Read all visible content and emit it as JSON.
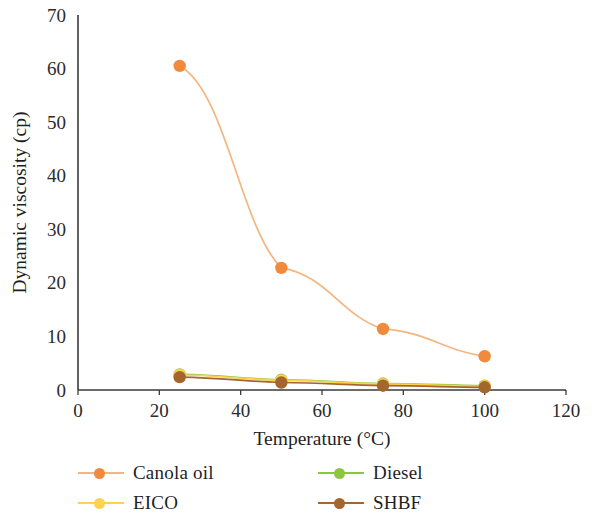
{
  "chart_data": {
    "type": "line",
    "title": "",
    "xlabel": "Temperature (°C)",
    "ylabel": "Dynamic viscosity (cp)",
    "xlim": [
      0,
      120
    ],
    "ylim": [
      0,
      70
    ],
    "xticks": [
      0,
      20,
      40,
      60,
      80,
      100,
      120
    ],
    "yticks": [
      0,
      10,
      20,
      30,
      40,
      50,
      60,
      70
    ],
    "xtick_labels": [
      "0",
      "20",
      "40",
      "60",
      "80",
      "100",
      "120"
    ],
    "ytick_labels": [
      "0",
      "10",
      "20",
      "30",
      "40",
      "50",
      "60",
      "70"
    ],
    "grid": false,
    "legend_position": "bottom",
    "x": [
      25,
      50,
      75,
      100
    ],
    "series": [
      {
        "name": "Canola oil",
        "color": "#F08A3C",
        "line_color": "#F3B681",
        "values": [
          60.5,
          22.8,
          11.4,
          6.3
        ]
      },
      {
        "name": "Diesel",
        "color": "#8CC63F",
        "line_color": "#8CC63F",
        "values": [
          2.9,
          1.9,
          1.2,
          0.8
        ]
      },
      {
        "name": "EICO",
        "color": "#FFD24D",
        "line_color": "#FFD24D",
        "values": [
          2.8,
          1.8,
          1.1,
          0.7
        ]
      },
      {
        "name": "SHBF",
        "color": "#A4652E",
        "line_color": "#A4652E",
        "values": [
          2.4,
          1.4,
          0.8,
          0.5
        ]
      }
    ]
  },
  "legend": {
    "items": [
      {
        "label": "Canola oil"
      },
      {
        "label": "Diesel"
      },
      {
        "label": "EICO"
      },
      {
        "label": "SHBF"
      }
    ]
  },
  "axes": {
    "x_title": "Temperature (°C)",
    "y_title": "Dynamic viscosity (cp)"
  }
}
